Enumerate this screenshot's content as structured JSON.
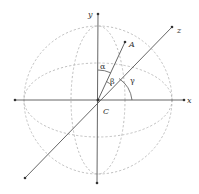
{
  "diagram": {
    "labels": {
      "x_axis": "x",
      "y_axis": "y",
      "z_axis": "z",
      "point_a": "A",
      "origin": "C",
      "alpha": "α",
      "beta": "β",
      "gamma": "γ"
    },
    "colors": {
      "axis": "#555555",
      "sphere_dash": "#b0b0b0",
      "text": "#333333"
    }
  }
}
